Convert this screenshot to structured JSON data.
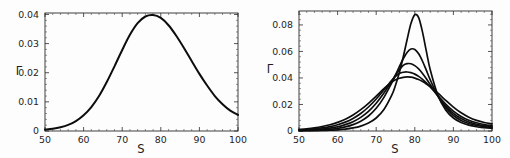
{
  "figure": {
    "background_color": "#fdfdfd",
    "curve_color": "#0d0d0d",
    "axis_color": "#2b2b2b"
  },
  "chart_data": [
    {
      "type": "line",
      "panel": "left",
      "title": "",
      "xlabel": "S",
      "ylabel": "Γ",
      "xlim": [
        50,
        100
      ],
      "ylim": [
        0,
        0.0405
      ],
      "grid": false,
      "legend": "none",
      "xticks": [
        50,
        60,
        70,
        80,
        90,
        100
      ],
      "xticklabels": [
        "50",
        "60",
        "70",
        "80",
        "90",
        "100"
      ],
      "yticks": [
        0,
        0.01,
        0.02,
        0.03,
        0.04
      ],
      "yticklabels": [
        "0",
        "0.01",
        "0.02",
        "0.03",
        "0.04"
      ],
      "series": [
        {
          "name": "broad-peak",
          "peak_x": 78,
          "peak_y": 0.0398,
          "x": [
            50,
            52,
            54,
            56,
            58,
            60,
            62,
            64,
            66,
            68,
            70,
            72,
            74,
            76,
            78,
            80,
            82,
            84,
            86,
            88,
            90,
            92,
            94,
            96,
            98,
            100
          ],
          "values": [
            0.0005,
            0.0008,
            0.0013,
            0.0021,
            0.0034,
            0.0054,
            0.0082,
            0.012,
            0.0168,
            0.0222,
            0.0278,
            0.033,
            0.037,
            0.0393,
            0.0398,
            0.0388,
            0.0363,
            0.0327,
            0.0285,
            0.024,
            0.0196,
            0.0156,
            0.012,
            0.0092,
            0.007,
            0.0055
          ]
        }
      ]
    },
    {
      "type": "line",
      "panel": "right",
      "title": "",
      "xlabel": "S",
      "ylabel": "Γ",
      "xlim": [
        50,
        100
      ],
      "ylim": [
        0,
        0.0905
      ],
      "grid": false,
      "legend": "none",
      "xticks": [
        50,
        60,
        70,
        80,
        90,
        100
      ],
      "xticklabels": [
        "50",
        "60",
        "70",
        "80",
        "90",
        "100"
      ],
      "yticks": [
        0,
        0.02,
        0.04,
        0.06,
        0.08
      ],
      "yticklabels": [
        "0",
        "0.02",
        "0.04",
        "0.06",
        "0.08"
      ],
      "x": [
        50,
        52,
        54,
        56,
        58,
        60,
        62,
        64,
        66,
        68,
        70,
        72,
        74,
        75,
        76,
        77,
        78,
        79,
        80,
        81,
        82,
        83,
        84,
        86,
        88,
        90,
        92,
        94,
        96,
        98,
        100
      ],
      "series": [
        {
          "name": "curve-1-tallest",
          "peak_x": 79.5,
          "peak_y": 0.088,
          "values": [
            0.0002,
            0.0002,
            0.0003,
            0.0004,
            0.0006,
            0.0009,
            0.0014,
            0.0023,
            0.0037,
            0.006,
            0.0098,
            0.0162,
            0.0268,
            0.0345,
            0.0441,
            0.0558,
            0.0688,
            0.081,
            0.0877,
            0.0855,
            0.0746,
            0.06,
            0.0462,
            0.0268,
            0.0158,
            0.0098,
            0.0064,
            0.0044,
            0.0032,
            0.0025,
            0.002
          ]
        },
        {
          "name": "curve-2",
          "peak_x": 79,
          "peak_y": 0.062,
          "values": [
            0.0003,
            0.0004,
            0.0006,
            0.0009,
            0.0013,
            0.002,
            0.0031,
            0.0048,
            0.0074,
            0.0113,
            0.0171,
            0.0254,
            0.0362,
            0.0423,
            0.0485,
            0.0545,
            0.0592,
            0.0618,
            0.0615,
            0.0582,
            0.0526,
            0.0457,
            0.0386,
            0.0263,
            0.0175,
            0.0117,
            0.008,
            0.0057,
            0.0042,
            0.0033,
            0.0027
          ]
        },
        {
          "name": "curve-3",
          "peak_x": 78.5,
          "peak_y": 0.051,
          "values": [
            0.0005,
            0.0007,
            0.001,
            0.0015,
            0.0022,
            0.0032,
            0.0048,
            0.007,
            0.0103,
            0.0148,
            0.0209,
            0.0286,
            0.0375,
            0.042,
            0.0462,
            0.0495,
            0.0508,
            0.0507,
            0.0493,
            0.0468,
            0.0434,
            0.0394,
            0.035,
            0.0262,
            0.0188,
            0.0133,
            0.0094,
            0.0068,
            0.0051,
            0.004,
            0.0033
          ]
        },
        {
          "name": "curve-4",
          "peak_x": 78,
          "peak_y": 0.0445,
          "values": [
            0.0008,
            0.0011,
            0.0016,
            0.0023,
            0.0033,
            0.0047,
            0.0067,
            0.0095,
            0.0132,
            0.0181,
            0.0241,
            0.031,
            0.038,
            0.0411,
            0.0434,
            0.0443,
            0.0445,
            0.044,
            0.0429,
            0.0412,
            0.039,
            0.0363,
            0.0333,
            0.0267,
            0.0203,
            0.015,
            0.011,
            0.0081,
            0.0062,
            0.0049,
            0.0041
          ]
        },
        {
          "name": "curve-5-broadest",
          "peak_x": 77.5,
          "peak_y": 0.0408,
          "values": [
            0.0012,
            0.0017,
            0.0024,
            0.0034,
            0.0047,
            0.0065,
            0.0089,
            0.0121,
            0.0161,
            0.0209,
            0.0263,
            0.0319,
            0.0368,
            0.0386,
            0.0398,
            0.0405,
            0.0408,
            0.0406,
            0.0399,
            0.0388,
            0.0373,
            0.0355,
            0.0334,
            0.0285,
            0.0231,
            0.018,
            0.0137,
            0.0104,
            0.008,
            0.0064,
            0.0054
          ]
        }
      ]
    }
  ]
}
